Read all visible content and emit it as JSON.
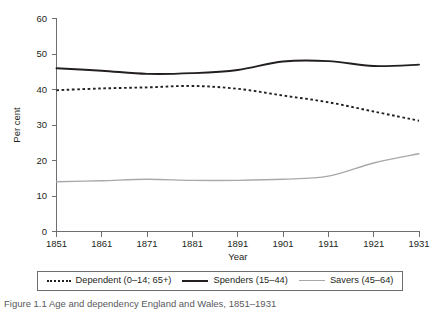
{
  "chart_data": {
    "type": "line",
    "title": "",
    "xlabel": "Year",
    "ylabel": "Per cent",
    "xlim": [
      1851,
      1931
    ],
    "ylim": [
      0,
      60
    ],
    "grid": false,
    "legend_position": "bottom",
    "x": [
      1851,
      1861,
      1871,
      1881,
      1891,
      1901,
      1911,
      1921,
      1931
    ],
    "xticks": [
      "1851",
      "1861",
      "1871",
      "1881",
      "1891",
      "1901",
      "1911",
      "1921",
      "1931"
    ],
    "yticks": [
      "0",
      "10",
      "20",
      "30",
      "40",
      "50",
      "60"
    ],
    "ytick_values": [
      0,
      10,
      20,
      30,
      40,
      50,
      60
    ],
    "series": [
      {
        "name": "Dependent (0–14; 65+)",
        "style": "dotted",
        "color": "#231f20",
        "values": [
          39.8,
          40.3,
          40.6,
          41.0,
          40.2,
          38.3,
          36.4,
          33.8,
          31.2
        ]
      },
      {
        "name": "Spenders (15–44)",
        "style": "solid",
        "color": "#231f20",
        "values": [
          46.0,
          45.3,
          44.4,
          44.6,
          45.5,
          47.9,
          48.0,
          46.6,
          47.0
        ]
      },
      {
        "name": "Savers (45–64)",
        "style": "solid-light",
        "color": "#a7a9ac",
        "values": [
          14.0,
          14.3,
          14.7,
          14.4,
          14.4,
          14.7,
          15.6,
          19.3,
          21.9
        ]
      }
    ]
  },
  "axes": {
    "y_title": "Per cent",
    "x_title": "Year"
  },
  "legend": {
    "entries": [
      {
        "label": "Dependent (0–14; 65+)"
      },
      {
        "label": "Spenders (15–44)"
      },
      {
        "label": "Savers (45–64)"
      }
    ]
  },
  "caption": {
    "text": "Figure 1.1 Age and dependency England and Wales, 1851–1931"
  }
}
